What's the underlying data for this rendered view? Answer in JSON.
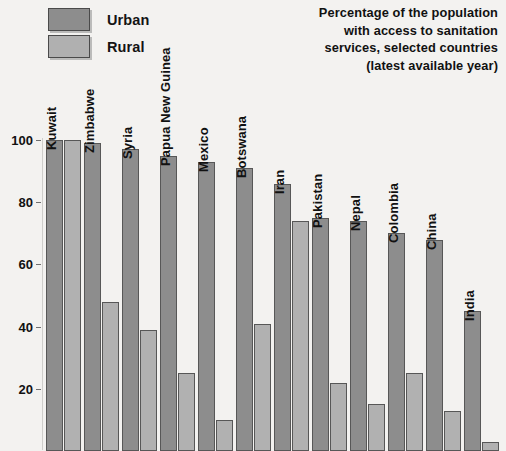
{
  "legend": {
    "items": [
      {
        "label": "Urban",
        "color": "#8d8d8d"
      },
      {
        "label": "Rural",
        "color": "#b1b1b1"
      }
    ]
  },
  "title": {
    "line1": "Percentage of the population",
    "line2": "with access to sanitation",
    "line3": "services, selected countries",
    "line4": "(latest available year)"
  },
  "chart_data": {
    "type": "bar",
    "title": "Percentage of the population with access to sanitation services, selected countries (latest available year)",
    "xlabel": "",
    "ylabel": "",
    "ylim": [
      0,
      100
    ],
    "ytick_labels": [
      "100",
      "80",
      "60",
      "40",
      "20"
    ],
    "yticks": [
      100,
      80,
      60,
      40,
      20
    ],
    "grid": false,
    "legend_position": "top-left",
    "categories": [
      "Kuwait",
      "Zimbabwe",
      "Syria",
      "Papua New Guinea",
      "Mexico",
      "Botswana",
      "Iran",
      "Pakistan",
      "Nepal",
      "Colombia",
      "China",
      "India"
    ],
    "series": [
      {
        "name": "Urban",
        "color": "#8d8d8d",
        "values": [
          100,
          99,
          97,
          95,
          93,
          91,
          86,
          75,
          74,
          70,
          68,
          45
        ]
      },
      {
        "name": "Rural",
        "color": "#b1b1b1",
        "values": [
          100,
          48,
          39,
          25,
          10,
          41,
          74,
          22,
          15,
          25,
          13,
          3
        ]
      }
    ]
  }
}
